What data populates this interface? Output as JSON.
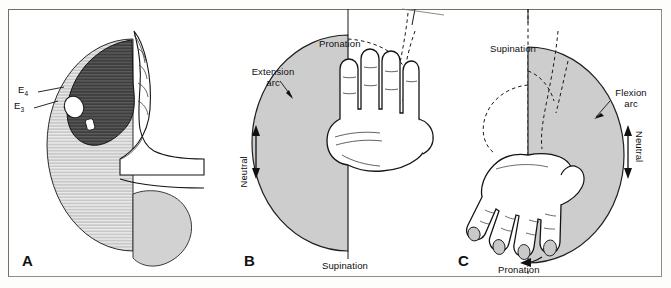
{
  "figure": {
    "background_color": "#fdfdfc",
    "frame_color": "#8d8d8d"
  },
  "palette": {
    "dark_gray": "#4a4a4a",
    "mid_gray": "#9d9d9d",
    "light_gray": "#cdcdcd",
    "pale_gray": "#d9d9d9",
    "hatch_gray": "#b8b8b8",
    "outline": "#1a1a1a",
    "skin_white": "#ffffff"
  },
  "panels": [
    {
      "id": "a",
      "letter": "A",
      "labels": [
        {
          "name": "label-e4",
          "text": "E",
          "sub": "4"
        },
        {
          "name": "label-e3",
          "text": "E",
          "sub": "3"
        }
      ],
      "regions": [
        {
          "name": "dark-arc-region",
          "fill": "dark_gray",
          "hatched": true
        },
        {
          "name": "light-arc-region",
          "fill": "light_gray",
          "hatched": true
        },
        {
          "name": "lower-lobe-region",
          "fill": "pale_gray",
          "hatched": false
        }
      ]
    },
    {
      "id": "b",
      "letter": "B",
      "labels": [
        {
          "name": "label-pronation",
          "text": "Pronation"
        },
        {
          "name": "label-extension-arc",
          "text": "Extension arc"
        },
        {
          "name": "label-neutral",
          "text": "Neutral"
        },
        {
          "name": "label-supination",
          "text": "Supination"
        }
      ],
      "regions": [
        {
          "name": "extension-arc-region",
          "fill": "light_gray",
          "hatched": false
        }
      ]
    },
    {
      "id": "c",
      "letter": "C",
      "labels": [
        {
          "name": "label-supination",
          "text": "Supination"
        },
        {
          "name": "label-flexion-arc",
          "text": "Flexion arc"
        },
        {
          "name": "label-neutral",
          "text": "Neutral"
        },
        {
          "name": "label-pronation",
          "text": "Pronation"
        }
      ],
      "regions": [
        {
          "name": "flexion-arc-region",
          "fill": "light_gray",
          "hatched": false
        }
      ]
    }
  ],
  "text": {
    "a": {
      "letter": "A",
      "e4": "E",
      "e4_sub": "4",
      "e3": "E",
      "e3_sub": "3"
    },
    "b": {
      "letter": "B",
      "pronation": "Pronation",
      "extension_arc_line1": "Extension",
      "extension_arc_line2": "arc",
      "neutral": "Neutral",
      "supination": "Supination"
    },
    "c": {
      "letter": "C",
      "supination": "Supination",
      "flexion_arc_line1": "Flexion",
      "flexion_arc_line2": "arc",
      "neutral": "Neutral",
      "pronation": "Pronation"
    }
  }
}
